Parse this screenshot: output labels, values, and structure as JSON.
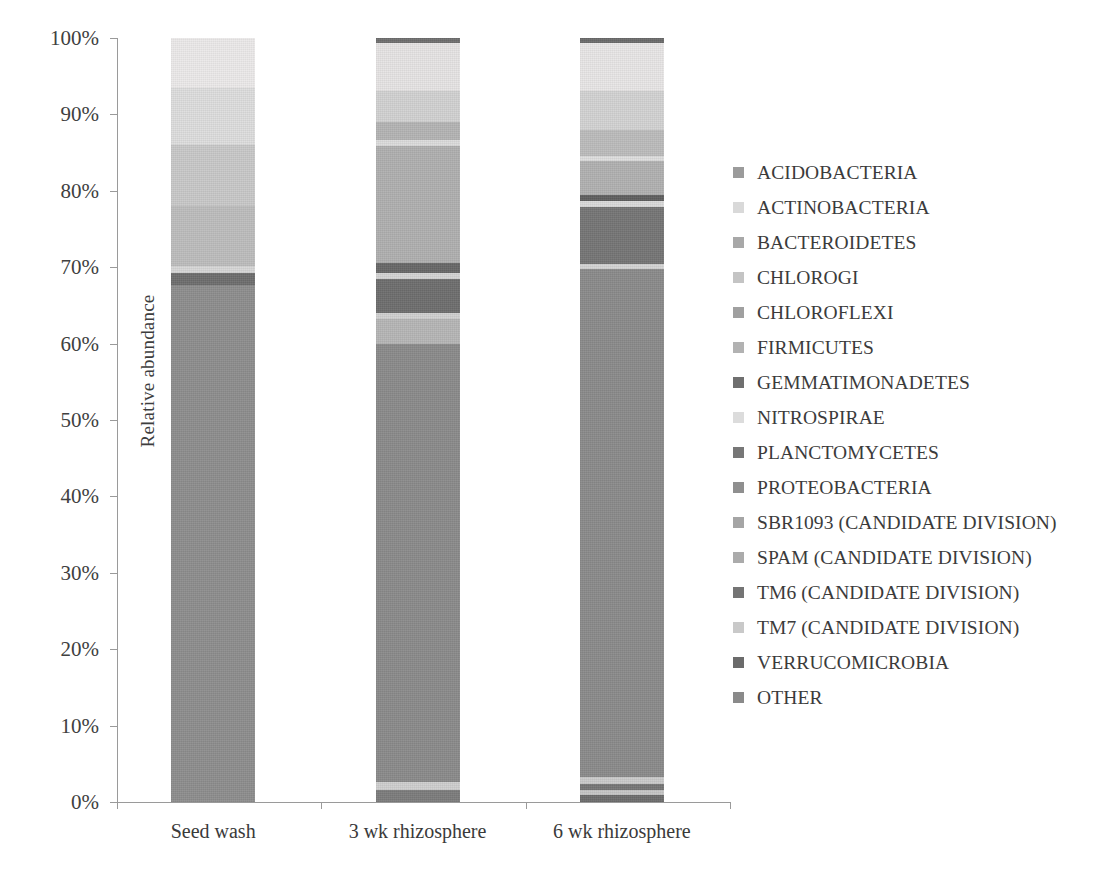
{
  "chart_data": {
    "type": "bar",
    "subtype": "stacked-100-percent",
    "title": "",
    "xlabel": "",
    "ylabel": "Relative abundance",
    "ylim": [
      0,
      100
    ],
    "yticks": [
      "0%",
      "10%",
      "20%",
      "30%",
      "40%",
      "50%",
      "60%",
      "70%",
      "80%",
      "90%",
      "100%"
    ],
    "ytick_values": [
      0,
      10,
      20,
      30,
      40,
      50,
      60,
      70,
      80,
      90,
      100
    ],
    "grid": false,
    "legend_position": "right",
    "categories": [
      "Seed wash",
      "3 wk rhizosphere",
      "6 wk rhizosphere"
    ],
    "series": [
      {
        "name": "ACIDOBACTERIA",
        "color": "#9b9b9b",
        "values": [
          0.0,
          1.3,
          1.0
        ]
      },
      {
        "name": "ACTINOBACTERIA",
        "color": "#d9d9d9",
        "values": [
          0.3,
          1.0,
          1.2
        ]
      },
      {
        "name": "BACTEROIDETES",
        "color": "#a8a8a8",
        "values": [
          67.8,
          58.5,
          66.0
        ]
      },
      {
        "name": "CHLOROGI",
        "color": "#c4c4c4",
        "values": [
          0.0,
          0.4,
          0.5
        ]
      },
      {
        "name": "CHLOROFLEXI",
        "color": "#a0a0a0",
        "values": [
          0.0,
          1.0,
          1.2
        ]
      },
      {
        "name": "FIRMICUTES",
        "color": "#b2b2b2",
        "values": [
          0.0,
          0.4,
          0.4
        ]
      },
      {
        "name": "GEMMATIMONADETES",
        "color": "#6f6f6f",
        "values": [
          0.6,
          2.2,
          2.4
        ]
      },
      {
        "name": "NITROSPIRAE",
        "color": "#dcdcdc",
        "values": [
          0.0,
          0.3,
          0.4
        ]
      },
      {
        "name": "PLANCTOMYCETES",
        "color": "#777777",
        "values": [
          0.0,
          3.0,
          6.0
        ]
      },
      {
        "name": "PROTEOBACTERIA",
        "color": "#8f8f8f",
        "values": [
          0.0,
          2.8,
          2.0
        ]
      },
      {
        "name": "SBR1093 (CANDIDATE DIVISION)",
        "color": "#a5a5a5",
        "values": [
          0.0,
          0.4,
          0.3
        ]
      },
      {
        "name": "SPAM (CANDIDATE DIVISION)",
        "color": "#ababab",
        "values": [
          0.0,
          0.4,
          0.3
        ]
      },
      {
        "name": "TM6 (CANDIDATE DIVISION)",
        "color": "#747474",
        "values": [
          0.0,
          2.0,
          3.3
        ]
      },
      {
        "name": "TM7 (CANDIDATE DIVISION)",
        "color": "#c9c9c9",
        "values": [
          0.0,
          1.0,
          1.3
        ]
      },
      {
        "name": "VERRUCOMICROBIA",
        "color": "#6b6b6b",
        "values": [
          0.5,
          4.5,
          3.5
        ]
      },
      {
        "name": "OTHER",
        "color": "#8a8a8a",
        "values": [
          30.8,
          20.8,
          10.2
        ]
      }
    ],
    "stacks": [
      {
        "category": "Seed wash",
        "segments": [
          {
            "name": "top-light-band",
            "color": "#eceaea",
            "from": 93.5,
            "to": 100.0
          },
          {
            "name": "upper-light-band",
            "color": "#dedede",
            "from": 86.0,
            "to": 93.5
          },
          {
            "name": "mid-light-band",
            "color": "#c9c9c9",
            "from": 78.0,
            "to": 86.0
          },
          {
            "name": "mid-band",
            "color": "#bdbdbd",
            "from": 70.2,
            "to": 78.0
          },
          {
            "name": "thin-light-line",
            "color": "#d7d7d7",
            "from": 69.2,
            "to": 70.2
          },
          {
            "name": "thin-dark-line",
            "color": "#6e6e6e",
            "from": 67.6,
            "to": 69.2
          },
          {
            "name": "main-dark-body",
            "color": "#8e8e8e",
            "from": 0.0,
            "to": 67.6
          }
        ]
      },
      {
        "category": "3 wk rhizosphere",
        "segments": [
          {
            "name": "top-cap-dark",
            "color": "#6f6f6f",
            "from": 99.4,
            "to": 100.0
          },
          {
            "name": "top-light-band",
            "color": "#e6e4e4",
            "from": 93.0,
            "to": 99.4
          },
          {
            "name": "upper-light-band",
            "color": "#d2d2d2",
            "from": 89.0,
            "to": 93.0
          },
          {
            "name": "upper-mid-band",
            "color": "#b4b4b4",
            "from": 86.6,
            "to": 89.0
          },
          {
            "name": "separator-light",
            "color": "#dcdcdc",
            "from": 85.9,
            "to": 86.6
          },
          {
            "name": "broad-grey-band",
            "color": "#b0b0b0",
            "from": 70.6,
            "to": 85.9
          },
          {
            "name": "dark-line-70",
            "color": "#686868",
            "from": 69.3,
            "to": 70.6
          },
          {
            "name": "light-line-69",
            "color": "#d4d4d4",
            "from": 68.5,
            "to": 69.3
          },
          {
            "name": "dark-block-64-68",
            "color": "#6e6e6e",
            "from": 64.0,
            "to": 68.5
          },
          {
            "name": "light-line-63",
            "color": "#d0d0d0",
            "from": 63.2,
            "to": 64.0
          },
          {
            "name": "grey-band-60-63",
            "color": "#b6b6b6",
            "from": 60.0,
            "to": 63.2
          },
          {
            "name": "main-dark-body",
            "color": "#8b8b8b",
            "from": 2.6,
            "to": 60.0
          },
          {
            "name": "light-band-bottom",
            "color": "#cfcfcf",
            "from": 1.6,
            "to": 2.6
          },
          {
            "name": "dark-base",
            "color": "#7c7c7c",
            "from": 0.0,
            "to": 1.6
          }
        ]
      },
      {
        "category": "6 wk rhizosphere",
        "segments": [
          {
            "name": "top-cap-dark",
            "color": "#6b6b6b",
            "from": 99.3,
            "to": 100.0
          },
          {
            "name": "top-light-band",
            "color": "#e8e6e6",
            "from": 93.0,
            "to": 99.3
          },
          {
            "name": "upper-light-band",
            "color": "#d3d3d3",
            "from": 88.0,
            "to": 93.0
          },
          {
            "name": "upper-mid-band",
            "color": "#bcbcbc",
            "from": 84.6,
            "to": 88.0
          },
          {
            "name": "separator-light-84",
            "color": "#dedede",
            "from": 83.9,
            "to": 84.6
          },
          {
            "name": "grey-band-79-84",
            "color": "#b1b1b1",
            "from": 79.4,
            "to": 83.9
          },
          {
            "name": "dark-line-79",
            "color": "#5f5f5f",
            "from": 78.6,
            "to": 79.4
          },
          {
            "name": "light-line-78",
            "color": "#dadada",
            "from": 77.9,
            "to": 78.6
          },
          {
            "name": "dark-block-70-78",
            "color": "#757575",
            "from": 70.4,
            "to": 77.9
          },
          {
            "name": "light-line-70",
            "color": "#d5d5d5",
            "from": 69.7,
            "to": 70.4
          },
          {
            "name": "main-dark-body",
            "color": "#8b8b8b",
            "from": 3.2,
            "to": 69.7
          },
          {
            "name": "light-band-3",
            "color": "#cbcbcb",
            "from": 2.3,
            "to": 3.2
          },
          {
            "name": "dark-line-2",
            "color": "#767676",
            "from": 1.6,
            "to": 2.3
          },
          {
            "name": "light-band-1",
            "color": "#c6c6c6",
            "from": 0.9,
            "to": 1.6
          },
          {
            "name": "dark-base",
            "color": "#6d6d6d",
            "from": 0.0,
            "to": 0.9
          }
        ]
      }
    ]
  }
}
